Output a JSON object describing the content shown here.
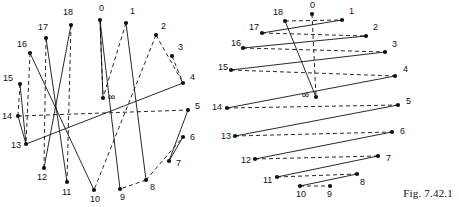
{
  "figure": {
    "caption": "Fig. 7.42.1",
    "infinity_symbol": "∞",
    "colors": {
      "ink": "#111111",
      "background": "#ffffff"
    },
    "stroke": {
      "solid": "solid",
      "dashed": "dashed"
    }
  },
  "left_diagram": {
    "name": "left-configuration",
    "vertices": [
      {
        "label": "0",
        "x": 100,
        "y": 20,
        "lx": 99,
        "ly": 11
      },
      {
        "label": "1",
        "x": 126,
        "y": 23,
        "lx": 130,
        "ly": 14
      },
      {
        "label": "2",
        "x": 156,
        "y": 35,
        "lx": 161,
        "ly": 29
      },
      {
        "label": "3",
        "x": 172,
        "y": 56,
        "lx": 178,
        "ly": 50
      },
      {
        "label": "4",
        "x": 183,
        "y": 83,
        "lx": 190,
        "ly": 80
      },
      {
        "label": "5",
        "x": 188,
        "y": 110,
        "lx": 195,
        "ly": 109
      },
      {
        "label": "6",
        "x": 183,
        "y": 137,
        "lx": 190,
        "ly": 140
      },
      {
        "label": "7",
        "x": 169,
        "y": 161,
        "lx": 176,
        "ly": 166
      },
      {
        "label": "8",
        "x": 146,
        "y": 180,
        "lx": 150,
        "ly": 190
      },
      {
        "label": "9",
        "x": 120,
        "y": 189,
        "lx": 120,
        "ly": 200
      },
      {
        "label": "10",
        "x": 94,
        "y": 190,
        "lx": 90,
        "ly": 202
      },
      {
        "label": "11",
        "x": 67,
        "y": 182,
        "lx": 62,
        "ly": 195
      },
      {
        "label": "12",
        "x": 44,
        "y": 168,
        "lx": 37,
        "ly": 180
      },
      {
        "label": "13",
        "x": 26,
        "y": 144,
        "lx": 11,
        "ly": 148
      },
      {
        "label": "14",
        "x": 18,
        "y": 116,
        "lx": 2,
        "ly": 119
      },
      {
        "label": "15",
        "x": 20,
        "y": 84,
        "lx": 3,
        "ly": 81
      },
      {
        "label": "16",
        "x": 30,
        "y": 53,
        "lx": 17,
        "ly": 47
      },
      {
        "label": "17",
        "x": 46,
        "y": 38,
        "lx": 38,
        "ly": 30
      },
      {
        "label": "18",
        "x": 71,
        "y": 25,
        "lx": 63,
        "ly": 15
      },
      {
        "label": "∞",
        "x": 103,
        "y": 98,
        "lx": 108,
        "ly": 100
      }
    ],
    "solid_edges": [
      [
        "0",
        "9"
      ],
      [
        "18",
        "12"
      ],
      [
        "17",
        "11"
      ],
      [
        "16",
        "10"
      ],
      [
        "15",
        "13"
      ],
      [
        "14",
        "13"
      ],
      [
        "13",
        "4"
      ],
      [
        "1",
        "8"
      ],
      [
        "5",
        "7"
      ],
      [
        "7",
        "6"
      ],
      [
        "0",
        "∞"
      ]
    ],
    "dashed_edges": [
      [
        "0",
        "∞"
      ],
      [
        "1",
        "∞"
      ],
      [
        "2",
        "4"
      ],
      [
        "3",
        "4"
      ],
      [
        "18",
        "11"
      ],
      [
        "17",
        "12"
      ],
      [
        "16",
        "13"
      ],
      [
        "14",
        "5"
      ],
      [
        "15",
        "14"
      ],
      [
        "8",
        "9"
      ],
      [
        "8",
        "6"
      ],
      [
        "2",
        "10"
      ]
    ]
  },
  "right_diagram": {
    "name": "right-configuration",
    "vertices": [
      {
        "label": "0",
        "x": 312,
        "y": 14,
        "lx": 310,
        "ly": 8
      },
      {
        "label": "1",
        "x": 342,
        "y": 20,
        "lx": 349,
        "ly": 14
      },
      {
        "label": "18",
        "x": 285,
        "y": 21,
        "lx": 273,
        "ly": 15
      },
      {
        "label": "17",
        "x": 262,
        "y": 33,
        "lx": 249,
        "ly": 30
      },
      {
        "label": "2",
        "x": 366,
        "y": 36,
        "lx": 373,
        "ly": 30
      },
      {
        "label": "16",
        "x": 243,
        "y": 48,
        "lx": 231,
        "ly": 46
      },
      {
        "label": "3",
        "x": 385,
        "y": 52,
        "lx": 392,
        "ly": 47
      },
      {
        "label": "15",
        "x": 231,
        "y": 70,
        "lx": 218,
        "ly": 70
      },
      {
        "label": "4",
        "x": 395,
        "y": 76,
        "lx": 403,
        "ly": 72
      },
      {
        "label": "∞",
        "x": 316,
        "y": 97,
        "lx": 302,
        "ly": 98
      },
      {
        "label": "14",
        "x": 227,
        "y": 108,
        "lx": 212,
        "ly": 110
      },
      {
        "label": "5",
        "x": 398,
        "y": 105,
        "lx": 406,
        "ly": 104
      },
      {
        "label": "13",
        "x": 235,
        "y": 136,
        "lx": 221,
        "ly": 139
      },
      {
        "label": "6",
        "x": 392,
        "y": 132,
        "lx": 400,
        "ly": 134
      },
      {
        "label": "12",
        "x": 255,
        "y": 159,
        "lx": 241,
        "ly": 163
      },
      {
        "label": "7",
        "x": 378,
        "y": 156,
        "lx": 386,
        "ly": 161
      },
      {
        "label": "11",
        "x": 277,
        "y": 177,
        "lx": 263,
        "ly": 183
      },
      {
        "label": "8",
        "x": 357,
        "y": 174,
        "lx": 360,
        "ly": 185
      },
      {
        "label": "10",
        "x": 300,
        "y": 186,
        "lx": 296,
        "ly": 197
      },
      {
        "label": "9",
        "x": 330,
        "y": 186,
        "lx": 327,
        "ly": 197
      }
    ],
    "solid_edges": [
      [
        "18",
        "∞"
      ],
      [
        "17",
        "1"
      ],
      [
        "16",
        "2"
      ],
      [
        "15",
        "3"
      ],
      [
        "14",
        "4"
      ],
      [
        "13",
        "5"
      ],
      [
        "12",
        "6"
      ],
      [
        "11",
        "7"
      ],
      [
        "10",
        "8"
      ]
    ],
    "dashed_edges": [
      [
        "18",
        "1"
      ],
      [
        "17",
        "2"
      ],
      [
        "16",
        "3"
      ],
      [
        "15",
        "4"
      ],
      [
        "14",
        "5"
      ],
      [
        "13",
        "6"
      ],
      [
        "12",
        "7"
      ],
      [
        "11",
        "8"
      ],
      [
        "10",
        "9"
      ],
      [
        "0",
        "∞"
      ]
    ]
  }
}
